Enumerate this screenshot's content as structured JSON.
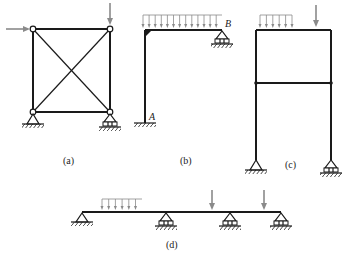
{
  "figure": {
    "colors": {
      "member": "#1a1a1a",
      "load": "#8a8a8a",
      "background": "#ffffff"
    },
    "panels": [
      {
        "id": "a",
        "caption": "(a)",
        "type": "pin-jointed square truss with crossed diagonals",
        "loads": [
          "horizontal point load at top-left node",
          "vertical point load at top-right node"
        ],
        "supports": [
          "pin at bottom-left",
          "roller at bottom-right"
        ]
      },
      {
        "id": "b",
        "caption": "(b)",
        "type": "L-shaped rigid frame",
        "labels": {
          "fixed_end": "A",
          "roller_end": "B"
        },
        "loads": [
          "uniformly distributed load over beam"
        ],
        "supports": [
          "fixed at A",
          "roller at B"
        ]
      },
      {
        "id": "c",
        "caption": "(c)",
        "type": "two-storey portal frame",
        "loads": [
          "partial distributed load on top beam (left)",
          "vertical point load on top beam (right)"
        ],
        "supports": [
          "pin at bottom-left",
          "roller at bottom-right"
        ]
      },
      {
        "id": "d",
        "caption": "(d)",
        "type": "continuous beam over four supports",
        "loads": [
          "distributed load on first span",
          "point load on third span",
          "point load near right end"
        ],
        "supports": [
          "pin at left end",
          "roller",
          "roller",
          "roller at right end"
        ]
      }
    ]
  }
}
